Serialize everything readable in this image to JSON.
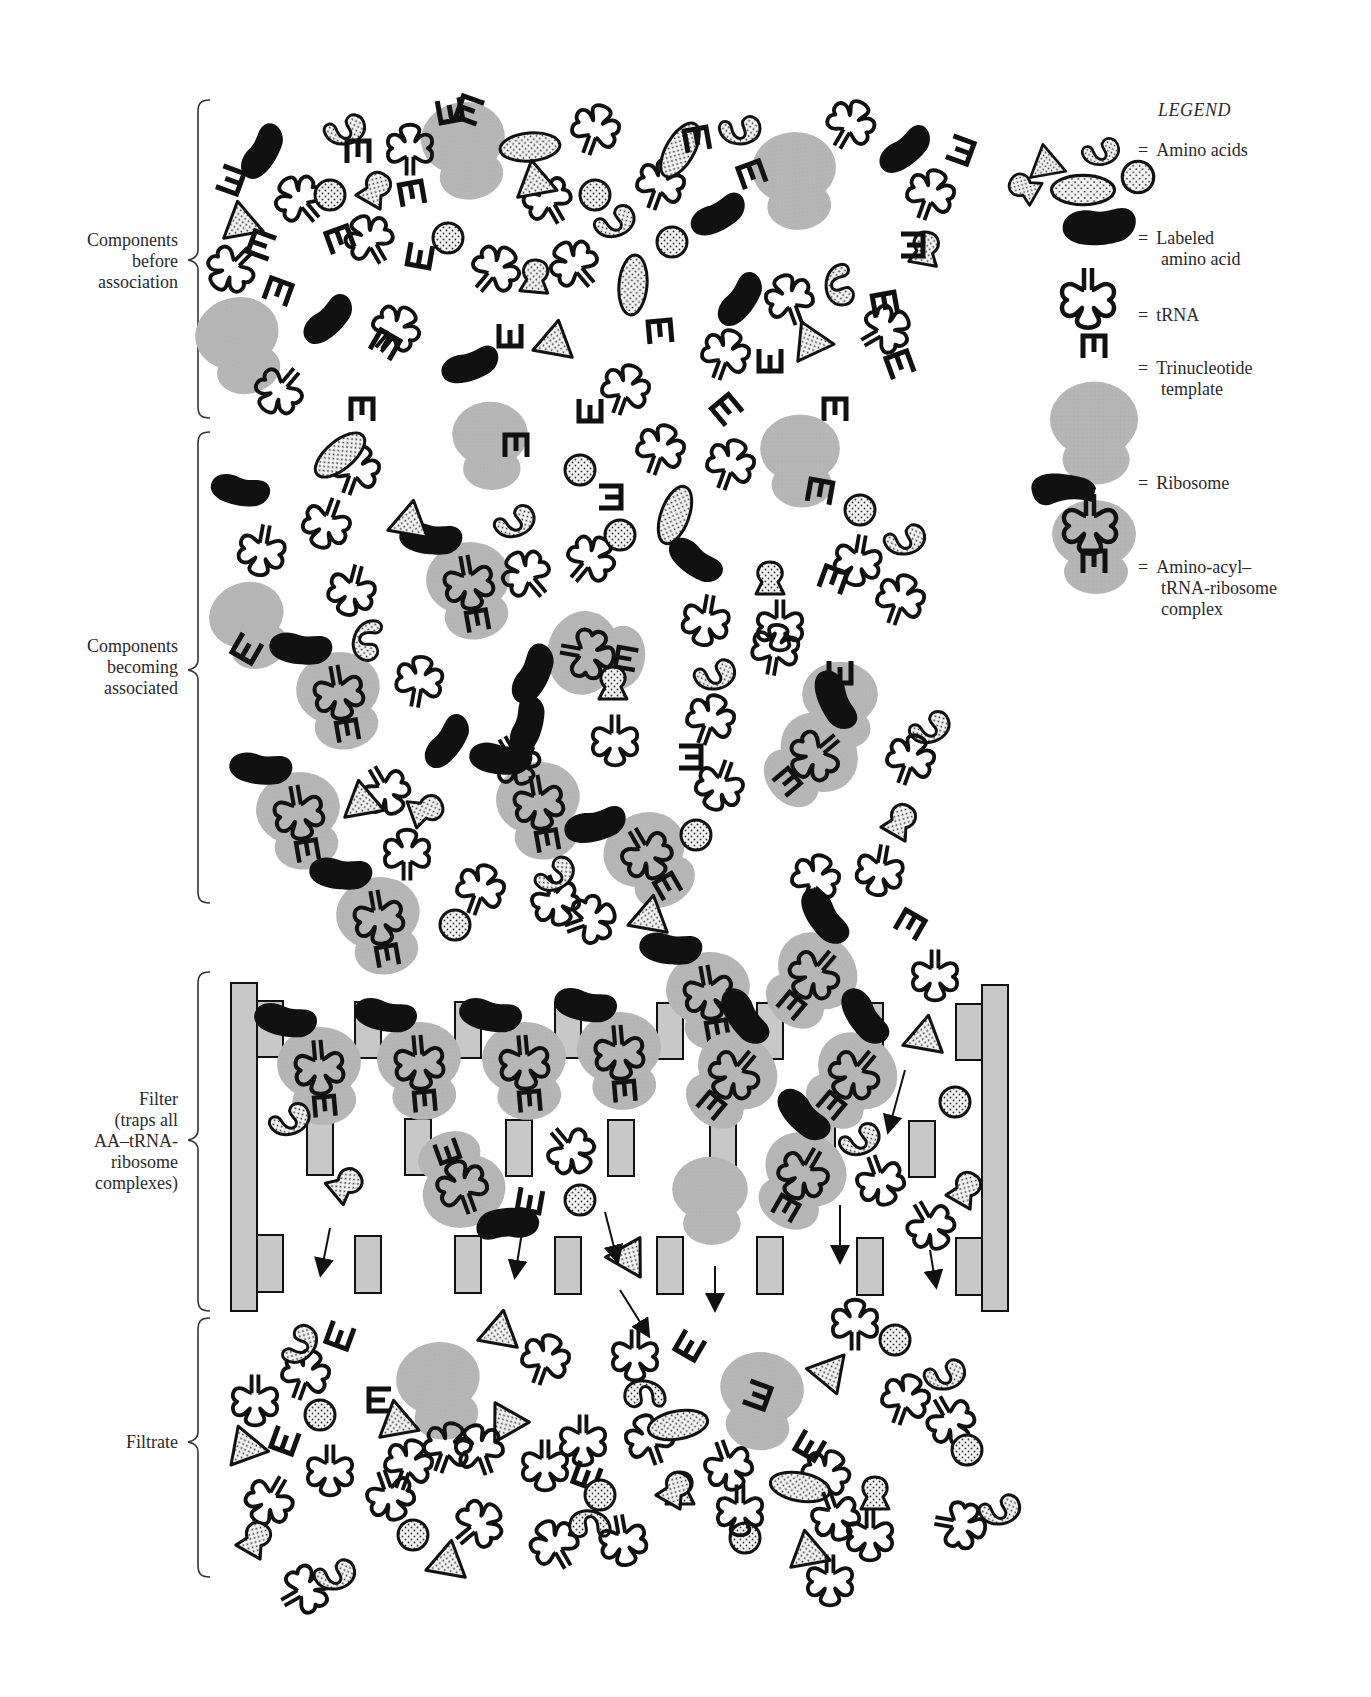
{
  "legend": {
    "title": "LEGEND",
    "items": [
      {
        "icon": "amino-acids-icon",
        "equals": "=",
        "label_lines": [
          "Amino acids"
        ]
      },
      {
        "icon": "labeled-amino-acid-icon",
        "equals": "=",
        "label_lines": [
          "Labeled",
          "amino acid"
        ]
      },
      {
        "icon": "trna-icon",
        "equals": "=",
        "label_lines": [
          "tRNA"
        ]
      },
      {
        "icon": "trinucleotide-template-icon",
        "equals": "=",
        "label_lines": [
          "Trinucleotide",
          "template"
        ]
      },
      {
        "icon": "ribosome-icon",
        "equals": "=",
        "label_lines": [
          "Ribosome"
        ]
      },
      {
        "icon": "aminoacyl-trna-ribosome-complex-icon",
        "equals": "=",
        "label_lines": [
          "Amino-acyl–",
          "tRNA-ribosome",
          "complex"
        ]
      }
    ]
  },
  "sections": [
    {
      "id": "before",
      "label_lines": [
        "Components",
        "before",
        "association"
      ]
    },
    {
      "id": "becoming",
      "label_lines": [
        "Components",
        "becoming",
        "associated"
      ]
    },
    {
      "id": "filter",
      "label_lines": [
        "Filter",
        "(traps all",
        "AA–tRNA-",
        "ribosome",
        "complexes)"
      ]
    },
    {
      "id": "filtrate",
      "label_lines": [
        "Filtrate"
      ]
    }
  ],
  "colors": {
    "ribosome_gray": "#b4b4b4",
    "filter_gray": "#c8c8c8",
    "labeled_black": "#111111",
    "stipple_fill": "#f2f2f2",
    "outline": "#111111"
  }
}
